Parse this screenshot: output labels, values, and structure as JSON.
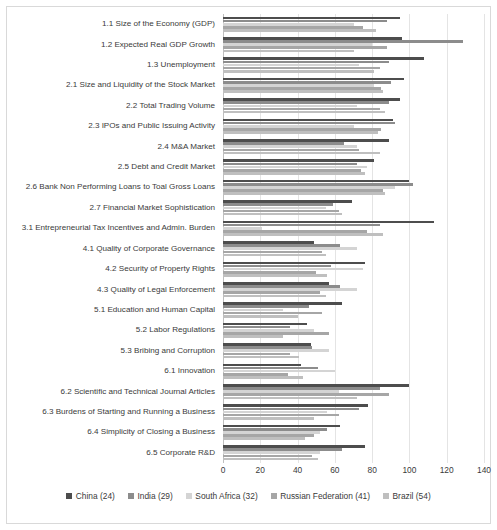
{
  "chart_data": {
    "type": "bar",
    "orientation": "horizontal",
    "title": "",
    "xlabel": "",
    "ylabel": "",
    "xlim": [
      0,
      140
    ],
    "xticks": [
      0,
      20,
      40,
      60,
      80,
      100,
      120,
      140
    ],
    "grid": true,
    "legend_position": "bottom",
    "categories": [
      "1.1 Size of the Economy (GDP)",
      "1.2 Expected Real GDP Growth",
      "1.3 Unemployment",
      "2.1 Size and Liquidity of the Stock Market",
      "2.2 Total Trading Volume",
      "2.3 IPOs and Public Issuing Activity",
      "2.4 M&A Market",
      "2.5 Debt and Credit Market",
      "2.6 Bank Non Performing Loans to Toal Gross Loans",
      "2.7 Financial Market Sophistication",
      "3.1 Entrepreneurial Tax Incentives and Admin. Burden",
      "4.1 Quality of Corporate Governance",
      "4.2 Security of Property Rights",
      "4.3 Quality of Legal Enforcement",
      "5.1 Education and Human Capital",
      "5.2 Labor Regulations",
      "5.3 Bribing and Corruption",
      "6.1 Innovation",
      "6.2 Scientific and Technical Journal Articles",
      "6.3 Burdens of Starting and Running a Business",
      "6.4 Simplicity of Closing a Business",
      "6.5 Corporate R&D"
    ],
    "series": [
      {
        "name": "China (24)",
        "color": "#4d4d4d",
        "values": [
          95,
          96,
          108,
          97,
          95,
          91,
          89,
          81,
          100,
          69,
          113,
          49,
          76,
          57,
          64,
          45,
          47,
          42,
          100,
          78,
          63,
          76
        ]
      },
      {
        "name": "India (29)",
        "color": "#8c8c8c",
        "values": [
          88,
          129,
          89,
          90,
          89,
          92,
          65,
          72,
          102,
          59,
          84,
          63,
          58,
          63,
          46,
          36,
          48,
          51,
          84,
          73,
          56,
          64
        ]
      },
      {
        "name": "South Africa (32)",
        "color": "#d4d4d4",
        "values": [
          70,
          80,
          73,
          81,
          72,
          70,
          72,
          77,
          92,
          55,
          21,
          72,
          75,
          72,
          32,
          49,
          57,
          60,
          62,
          56,
          52,
          52
        ]
      },
      {
        "name": "Russian Federation (41)",
        "color": "#a6a6a6",
        "values": [
          75,
          88,
          84,
          85,
          84,
          85,
          73,
          74,
          86,
          62,
          77,
          53,
          50,
          52,
          53,
          57,
          36,
          35,
          89,
          62,
          49,
          48
        ]
      },
      {
        "name": "Brazil (54)",
        "color": "#bfbfbf",
        "values": [
          82,
          70,
          81,
          86,
          87,
          83,
          84,
          76,
          87,
          64,
          86,
          55,
          56,
          55,
          40,
          32,
          41,
          43,
          72,
          49,
          44,
          51
        ]
      }
    ]
  }
}
